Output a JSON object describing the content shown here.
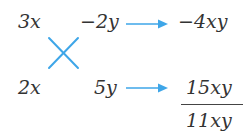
{
  "diagram": {
    "type": "cross-multiplication",
    "colors": {
      "text": "#333333",
      "accent": "#3ea6e8",
      "fraction_line": "#444444",
      "background": "#ffffff"
    },
    "left_column": {
      "top": "3x",
      "bottom": "2x"
    },
    "middle_column": {
      "top": "−2y",
      "bottom": "5y"
    },
    "cross_icon": "cross-x-icon",
    "arrows": [
      {
        "name": "arrow-right-icon",
        "row": "top"
      },
      {
        "name": "arrow-right-icon",
        "row": "bottom"
      }
    ],
    "results": {
      "top": "−4xy",
      "bottom_numerator": "15xy",
      "sum": "11xy"
    }
  }
}
